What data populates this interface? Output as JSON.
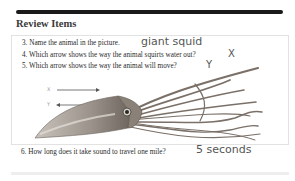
{
  "section": {
    "title": "Review Items"
  },
  "questions": [
    {
      "number": "3.",
      "text": "3. Name the animal in the picture.",
      "answer": "giant squid"
    },
    {
      "number": "4.",
      "text": "4. Which arrow shows the way the animal squirts water out?",
      "answer": "X"
    },
    {
      "number": "5.",
      "text": "5. Which arrow shows the way the animal will move?",
      "answer": "Y"
    },
    {
      "number": "6.",
      "text": "6. How long does it take sound to travel one mile?",
      "answer": "5 seconds"
    }
  ],
  "figure": {
    "arrows": [
      {
        "label": "X",
        "direction": "right"
      },
      {
        "label": "Y",
        "direction": "left"
      }
    ]
  },
  "colors": {
    "rule": "#1a1a1a",
    "answer_ink": "#555555",
    "squid_body": "#8a8178"
  }
}
